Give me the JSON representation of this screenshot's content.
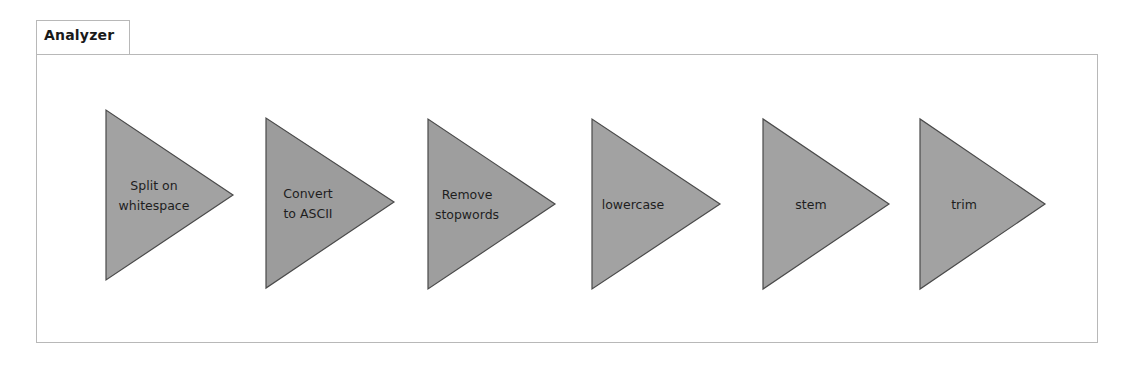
{
  "panel": {
    "title": "Analyzer"
  },
  "colors": {
    "triangle_fill": "#a2a2a2",
    "triangle_stroke": "#4a4a4a",
    "border": "#b8b8b8",
    "text": "#1e1e1e"
  },
  "stages": [
    {
      "lines": [
        "Split on",
        "whitespace"
      ]
    },
    {
      "lines": [
        "Convert",
        "to  ASCII"
      ]
    },
    {
      "lines": [
        "Remove",
        "stopwords"
      ]
    },
    {
      "lines": [
        "lowercase"
      ]
    },
    {
      "lines": [
        "stem"
      ]
    },
    {
      "lines": [
        "trim"
      ]
    }
  ]
}
